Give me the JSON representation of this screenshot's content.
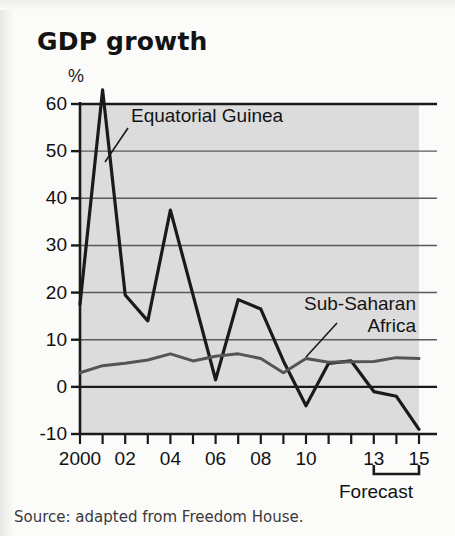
{
  "title": "GDP growth",
  "unit_label": "%",
  "source": "Source: adapted from Freedom House.",
  "forecast_label": "Forecast",
  "labels": {
    "series_1": "Equatorial Guinea",
    "series_2a": "Sub-Saharan",
    "series_2b": "Africa"
  },
  "colors": {
    "plot_background": "#dcdcdc",
    "page_background": "#fbfbfa",
    "axis": "#1a1a1a",
    "gridline": "#5a5a5a",
    "series_1": "#1a1a1a",
    "series_2": "#545454",
    "text": "#111111"
  },
  "chart_data": {
    "type": "line",
    "title": "GDP growth",
    "xlabel": "",
    "ylabel": "%",
    "ylim": [
      -10,
      60
    ],
    "yticks": [
      60,
      50,
      40,
      30,
      20,
      10,
      0,
      -10
    ],
    "xlim": [
      2000,
      2015
    ],
    "x": [
      2000,
      2001,
      2002,
      2003,
      2004,
      2005,
      2006,
      2007,
      2008,
      2009,
      2010,
      2011,
      2012,
      2013,
      2014,
      2015
    ],
    "xticks": [
      2000,
      2001,
      2002,
      2003,
      2004,
      2005,
      2006,
      2007,
      2008,
      2009,
      2010,
      2011,
      2012,
      2013,
      2014,
      2015
    ],
    "xtick_labels": [
      "2000",
      "",
      "02",
      "",
      "04",
      "",
      "06",
      "",
      "08",
      "",
      "10",
      "",
      "",
      "13",
      "",
      "15"
    ],
    "grid": true,
    "legend": "annotations",
    "forecast_range": [
      2013,
      2015
    ],
    "series": [
      {
        "name": "Equatorial Guinea",
        "color": "#1a1a1a",
        "values": [
          17.5,
          63.0,
          19.5,
          14.0,
          37.5,
          19.5,
          1.5,
          18.5,
          16.5,
          5.5,
          -4.0,
          5.0,
          5.5,
          -1.0,
          -2.0,
          -9.0
        ]
      },
      {
        "name": "Sub-Saharan Africa",
        "color": "#545454",
        "values": [
          3.0,
          4.5,
          5.0,
          5.7,
          7.0,
          5.5,
          6.5,
          7.0,
          6.0,
          3.0,
          6.0,
          5.2,
          5.3,
          5.4,
          6.2,
          6.0
        ]
      }
    ]
  }
}
